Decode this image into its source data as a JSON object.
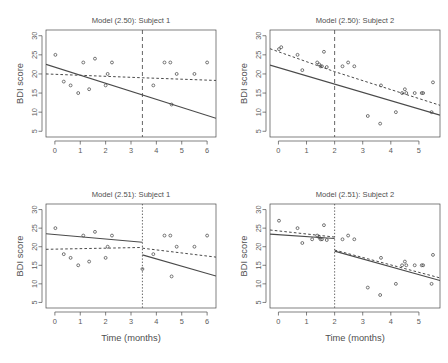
{
  "figure": {
    "background": "#ffffff",
    "foreground": "#4a4a4a",
    "xlabel": "Time (months)",
    "ylabel": "BDI score",
    "ylim": [
      3.5,
      31.5
    ],
    "yticks": [
      5,
      10,
      15,
      20,
      25,
      30
    ],
    "ytick_labels": [
      "5",
      "10",
      "15",
      "20",
      "25",
      "30"
    ],
    "point_symbol": "open-circle",
    "line_styles": {
      "solid": "solid",
      "dashed": "dashed",
      "breakpoint": "dashed-vertical"
    }
  },
  "chart_data": [
    {
      "id": "panel-tl",
      "type": "scatter",
      "title": "Model (2.50): Subject 1",
      "xlabel": "",
      "ylabel": "BDI score",
      "xlim": [
        -0.35,
        6.35
      ],
      "ylim": [
        3.5,
        31.5
      ],
      "xticks": [
        0,
        1,
        2,
        3,
        4,
        5,
        6
      ],
      "xtick_labels": [
        "0",
        "1",
        "2",
        "3",
        "4",
        "5",
        "6"
      ],
      "yticks": [
        5,
        10,
        15,
        20,
        25,
        30
      ],
      "ytick_labels": [
        "5",
        "10",
        "15",
        "20",
        "25",
        "30"
      ],
      "grid": false,
      "legend": "none",
      "breakpoint": {
        "x": 3.45,
        "style": "dashed",
        "label": ""
      },
      "points": [
        [
          0.02,
          25
        ],
        [
          0.35,
          18
        ],
        [
          0.62,
          17
        ],
        [
          0.92,
          15
        ],
        [
          1.12,
          23
        ],
        [
          1.35,
          16
        ],
        [
          1.58,
          24
        ],
        [
          2.0,
          17
        ],
        [
          2.08,
          20
        ],
        [
          2.25,
          23
        ],
        [
          3.88,
          17
        ],
        [
          4.32,
          23
        ],
        [
          4.55,
          23
        ],
        [
          4.6,
          12
        ],
        [
          4.8,
          20
        ],
        [
          5.5,
          20
        ],
        [
          6.0,
          23
        ]
      ],
      "series": [
        {
          "name": "subject-specific fit",
          "style": "solid",
          "x": [
            -0.35,
            6.35
          ],
          "y": [
            22.5,
            8.4
          ]
        },
        {
          "name": "population mean fit",
          "style": "dashed",
          "x": [
            -0.35,
            3.45,
            6.35
          ],
          "y": [
            20.0,
            19.0,
            18.3
          ]
        }
      ]
    },
    {
      "id": "panel-tr",
      "type": "scatter",
      "title": "Model (2.50): Subject 2",
      "xlabel": "",
      "ylabel": "BDI score",
      "xlim": [
        -0.3,
        5.75
      ],
      "ylim": [
        3.5,
        31.5
      ],
      "xticks": [
        0,
        1,
        2,
        3,
        4,
        5
      ],
      "xtick_labels": [
        "0",
        "1",
        "2",
        "3",
        "4",
        "5"
      ],
      "yticks": [
        5,
        10,
        15,
        20,
        25,
        30
      ],
      "ytick_labels": [
        "5",
        "10",
        "15",
        "20",
        "25",
        "30"
      ],
      "grid": false,
      "legend": "none",
      "breakpoint": {
        "x": 2.0,
        "style": "dashed",
        "label": ""
      },
      "points": [
        [
          0.02,
          26.5
        ],
        [
          0.1,
          27
        ],
        [
          0.68,
          25
        ],
        [
          0.85,
          21
        ],
        [
          1.38,
          23
        ],
        [
          1.45,
          22.5
        ],
        [
          1.5,
          22
        ],
        [
          1.55,
          22
        ],
        [
          1.62,
          25.8
        ],
        [
          1.72,
          21.8
        ],
        [
          2.28,
          22
        ],
        [
          2.48,
          23
        ],
        [
          2.7,
          22
        ],
        [
          3.18,
          9
        ],
        [
          3.62,
          7
        ],
        [
          3.65,
          17
        ],
        [
          4.18,
          10
        ],
        [
          4.4,
          15
        ],
        [
          4.5,
          16
        ],
        [
          4.55,
          15
        ],
        [
          4.85,
          15
        ],
        [
          5.1,
          15
        ],
        [
          5.15,
          15
        ],
        [
          5.45,
          10
        ],
        [
          5.5,
          17.8
        ]
      ],
      "series": [
        {
          "name": "subject-specific fit",
          "style": "solid",
          "x": [
            -0.3,
            5.75
          ],
          "y": [
            22.3,
            9.2
          ]
        },
        {
          "name": "population mean fit",
          "style": "dashed",
          "x": [
            -0.3,
            2.0,
            5.75
          ],
          "y": [
            26.6,
            20.6,
            11.8
          ]
        }
      ]
    },
    {
      "id": "panel-bl",
      "type": "scatter",
      "title": "Model (2.51): Subject 1",
      "xlabel": "Time (months)",
      "ylabel": "BDI score",
      "xlim": [
        -0.35,
        6.35
      ],
      "ylim": [
        3.5,
        31.5
      ],
      "xticks": [
        0,
        1,
        2,
        3,
        4,
        5,
        6
      ],
      "xtick_labels": [
        "0",
        "1",
        "2",
        "3",
        "4",
        "5",
        "6"
      ],
      "yticks": [
        5,
        10,
        15,
        20,
        25,
        30
      ],
      "ytick_labels": [
        "5",
        "10",
        "15",
        "20",
        "25",
        "30"
      ],
      "grid": false,
      "legend": "none",
      "breakpoint": {
        "x": 3.45,
        "style": "dotted",
        "label": ""
      },
      "points": [
        [
          0.02,
          25
        ],
        [
          0.35,
          18
        ],
        [
          0.62,
          17
        ],
        [
          0.92,
          15
        ],
        [
          1.12,
          23
        ],
        [
          1.35,
          16
        ],
        [
          1.58,
          24
        ],
        [
          2.0,
          17
        ],
        [
          2.08,
          20
        ],
        [
          2.25,
          23
        ],
        [
          3.45,
          14
        ],
        [
          3.88,
          18
        ],
        [
          4.32,
          23
        ],
        [
          4.55,
          23
        ],
        [
          4.6,
          12
        ],
        [
          4.8,
          20
        ],
        [
          5.5,
          20
        ],
        [
          6.0,
          23
        ]
      ],
      "series": [
        {
          "name": "subject-specific fit pre",
          "style": "solid",
          "x": [
            -0.35,
            3.45
          ],
          "y": [
            23.5,
            21.2
          ]
        },
        {
          "name": "subject-specific fit post",
          "style": "solid",
          "x": [
            3.45,
            6.35
          ],
          "y": [
            17.8,
            12.1
          ]
        },
        {
          "name": "population mean fit pre",
          "style": "dashed",
          "x": [
            -0.35,
            3.45
          ],
          "y": [
            19.3,
            19.8
          ]
        },
        {
          "name": "population mean fit post",
          "style": "dashed",
          "x": [
            3.45,
            6.35
          ],
          "y": [
            19.6,
            17.2
          ]
        }
      ]
    },
    {
      "id": "panel-br",
      "type": "scatter",
      "title": "Model (2.51): Subject 2",
      "xlabel": "Time (months)",
      "ylabel": "BDI score",
      "xlim": [
        -0.3,
        5.75
      ],
      "ylim": [
        3.5,
        31.5
      ],
      "xticks": [
        0,
        1,
        2,
        3,
        4,
        5
      ],
      "xtick_labels": [
        "0",
        "1",
        "2",
        "3",
        "4",
        "5"
      ],
      "yticks": [
        5,
        10,
        15,
        20,
        25,
        30
      ],
      "ytick_labels": [
        "5",
        "10",
        "15",
        "20",
        "25",
        "30"
      ],
      "grid": false,
      "legend": "none",
      "breakpoint": {
        "x": 2.0,
        "style": "dotted",
        "label": ""
      },
      "points": [
        [
          0.02,
          27
        ],
        [
          0.68,
          25
        ],
        [
          0.85,
          21
        ],
        [
          1.2,
          22
        ],
        [
          1.38,
          23
        ],
        [
          1.45,
          22.5
        ],
        [
          1.5,
          22
        ],
        [
          1.55,
          22
        ],
        [
          1.62,
          25.8
        ],
        [
          1.72,
          21.8
        ],
        [
          2.28,
          22
        ],
        [
          2.48,
          23
        ],
        [
          2.7,
          22
        ],
        [
          3.18,
          9
        ],
        [
          3.62,
          7
        ],
        [
          3.65,
          17
        ],
        [
          4.18,
          10
        ],
        [
          4.4,
          15
        ],
        [
          4.5,
          16
        ],
        [
          4.55,
          15
        ],
        [
          4.85,
          15
        ],
        [
          5.1,
          15
        ],
        [
          5.15,
          15
        ],
        [
          5.45,
          10
        ],
        [
          5.5,
          17.8
        ]
      ],
      "series": [
        {
          "name": "subject-specific fit pre",
          "style": "solid",
          "x": [
            -0.3,
            2.0
          ],
          "y": [
            23.4,
            22.2
          ]
        },
        {
          "name": "subject-specific fit post",
          "style": "solid",
          "x": [
            2.0,
            5.75
          ],
          "y": [
            18.8,
            10.9
          ]
        },
        {
          "name": "population mean fit pre",
          "style": "dashed",
          "x": [
            -0.3,
            2.0
          ],
          "y": [
            24.5,
            22.6
          ]
        },
        {
          "name": "population mean fit post",
          "style": "dashed",
          "x": [
            2.0,
            5.75
          ],
          "y": [
            19.1,
            11.6
          ]
        }
      ]
    }
  ]
}
